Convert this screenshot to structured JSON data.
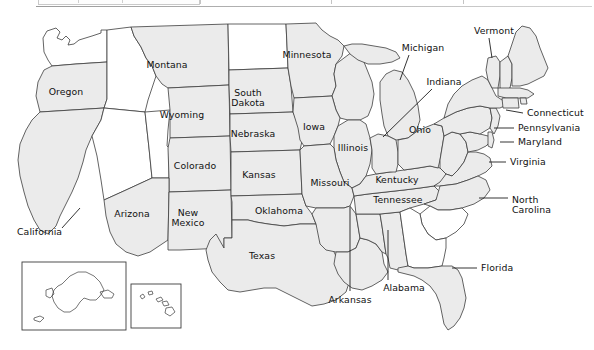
{
  "document": {
    "title": "Map of the United States with selected states labeled",
    "type": "reference-map",
    "background_color": "#ffffff",
    "shaded_state_fill": "#ebebeb",
    "unshaded_state_fill": "#ffffff",
    "border_color": "#3c3c3c",
    "label_color": "#111111"
  },
  "toolbar_remnant": {
    "visible": true,
    "description": "faint cut-off toolbar strip at top of screenshot"
  },
  "map": {
    "projection_note": "contiguous United States with Alaska and Hawaii insets",
    "insets": [
      {
        "name": "alaska-inset",
        "label": "",
        "x": 22,
        "y": 262,
        "width": 104,
        "height": 68
      },
      {
        "name": "hawaii-inset",
        "label": "",
        "x": 131,
        "y": 284,
        "width": 50,
        "height": 44
      }
    ],
    "labels": [
      {
        "name": "oregon",
        "text": "Oregon",
        "x": 66,
        "y": 92,
        "align": "center",
        "leader": null
      },
      {
        "name": "california",
        "text": "California",
        "x": 17,
        "y": 232,
        "align": "left",
        "leader": {
          "x1": 62,
          "y1": 228,
          "x2": 80,
          "y2": 208
        }
      },
      {
        "name": "montana",
        "text": "Montana",
        "x": 167,
        "y": 65,
        "align": "center",
        "leader": null
      },
      {
        "name": "wyoming",
        "text": "Wyoming",
        "x": 182,
        "y": 115,
        "align": "center",
        "leader": null
      },
      {
        "name": "colorado",
        "text": "Colorado",
        "x": 195,
        "y": 166,
        "align": "center",
        "leader": null
      },
      {
        "name": "arizona",
        "text": "Arizona",
        "x": 132,
        "y": 214,
        "align": "center",
        "leader": null
      },
      {
        "name": "new-mexico",
        "text": "New\nMexico",
        "x": 188,
        "y": 218,
        "align": "center",
        "leader": null
      },
      {
        "name": "south-dakota",
        "text": "South\nDakota",
        "x": 248,
        "y": 98,
        "align": "center",
        "leader": null
      },
      {
        "name": "nebraska",
        "text": "Nebraska",
        "x": 253,
        "y": 134,
        "align": "center",
        "leader": null
      },
      {
        "name": "kansas",
        "text": "Kansas",
        "x": 259,
        "y": 175,
        "align": "center",
        "leader": null
      },
      {
        "name": "oklahoma",
        "text": "Oklahoma",
        "x": 279,
        "y": 211,
        "align": "center",
        "leader": null
      },
      {
        "name": "texas",
        "text": "Texas",
        "x": 262,
        "y": 256,
        "align": "center",
        "leader": null
      },
      {
        "name": "minnesota",
        "text": "Minnesota",
        "x": 307,
        "y": 55,
        "align": "center",
        "leader": null
      },
      {
        "name": "iowa",
        "text": "Iowa",
        "x": 314,
        "y": 127,
        "align": "center",
        "leader": null
      },
      {
        "name": "illinois",
        "text": "Illinois",
        "x": 353,
        "y": 148,
        "align": "center",
        "leader": null
      },
      {
        "name": "missouri",
        "text": "Missouri",
        "x": 330,
        "y": 183,
        "align": "center",
        "leader": null
      },
      {
        "name": "arkansas",
        "text": "Arkansas",
        "x": 350,
        "y": 300,
        "align": "center",
        "leader": {
          "x1": 350,
          "y1": 291,
          "x2": 350,
          "y2": 207
        }
      },
      {
        "name": "alabama",
        "text": "Alabama",
        "x": 404,
        "y": 288,
        "align": "center",
        "leader": {
          "x1": 388,
          "y1": 280,
          "x2": 388,
          "y2": 230
        }
      },
      {
        "name": "tennessee",
        "text": "Tennessee",
        "x": 398,
        "y": 200,
        "align": "center",
        "leader": null
      },
      {
        "name": "kentucky",
        "text": "Kentucky",
        "x": 397,
        "y": 180,
        "align": "center",
        "leader": null
      },
      {
        "name": "ohio",
        "text": "Ohio",
        "x": 420,
        "y": 130,
        "align": "center",
        "leader": null
      },
      {
        "name": "michigan",
        "text": "Michigan",
        "x": 423,
        "y": 48,
        "align": "center",
        "leader": {
          "x1": 409,
          "y1": 55,
          "x2": 400,
          "y2": 80
        }
      },
      {
        "name": "indiana",
        "text": "Indiana",
        "x": 444,
        "y": 82,
        "align": "center",
        "leader": {
          "x1": 432,
          "y1": 89,
          "x2": 383,
          "y2": 137
        }
      },
      {
        "name": "vermont",
        "text": "Vermont",
        "x": 494,
        "y": 31,
        "align": "center",
        "leader": {
          "x1": 489,
          "y1": 38,
          "x2": 492,
          "y2": 58
        }
      },
      {
        "name": "connecticut",
        "text": "Connecticut",
        "x": 527,
        "y": 113,
        "align": "left",
        "leader": {
          "x1": 523,
          "y1": 113,
          "x2": 506,
          "y2": 110
        }
      },
      {
        "name": "pennsylvania",
        "text": "Pennsylvania",
        "x": 518,
        "y": 128,
        "align": "left",
        "leader": {
          "x1": 514,
          "y1": 128,
          "x2": 494,
          "y2": 128
        }
      },
      {
        "name": "maryland",
        "text": "Maryland",
        "x": 518,
        "y": 142,
        "align": "left",
        "leader": {
          "x1": 514,
          "y1": 142,
          "x2": 500,
          "y2": 142
        }
      },
      {
        "name": "virginia",
        "text": "Virginia",
        "x": 510,
        "y": 162,
        "align": "left",
        "leader": {
          "x1": 506,
          "y1": 162,
          "x2": 489,
          "y2": 162
        }
      },
      {
        "name": "north-carolina",
        "text": "North\nCarolina",
        "x": 512,
        "y": 205,
        "align": "left",
        "leader": {
          "x1": 508,
          "y1": 198,
          "x2": 479,
          "y2": 198
        }
      },
      {
        "name": "florida",
        "text": "Florida",
        "x": 481,
        "y": 268,
        "align": "left",
        "leader": {
          "x1": 477,
          "y1": 268,
          "x2": 452,
          "y2": 268
        }
      }
    ],
    "shaded_states": [
      "Oregon",
      "California",
      "Montana",
      "Wyoming",
      "Colorado",
      "Arizona",
      "New Mexico",
      "South Dakota",
      "Nebraska",
      "Kansas",
      "Oklahoma",
      "Texas",
      "Minnesota",
      "Iowa",
      "Illinois",
      "Missouri",
      "Arkansas",
      "Alabama",
      "Tennessee",
      "Kentucky",
      "Ohio",
      "Michigan",
      "Indiana",
      "Vermont",
      "Connecticut",
      "Pennsylvania",
      "Maryland",
      "Virginia",
      "North Carolina",
      "Florida",
      "Maine",
      "Wisconsin",
      "Louisiana",
      "Mississippi",
      "West Virginia",
      "New York",
      "New Hampshire",
      "Massachusetts",
      "Rhode Island",
      "New Jersey",
      "Delaware"
    ],
    "unshaded_states": [
      "Washington",
      "Idaho",
      "Nevada",
      "Utah",
      "North Dakota",
      "South Carolina",
      "Georgia"
    ]
  }
}
